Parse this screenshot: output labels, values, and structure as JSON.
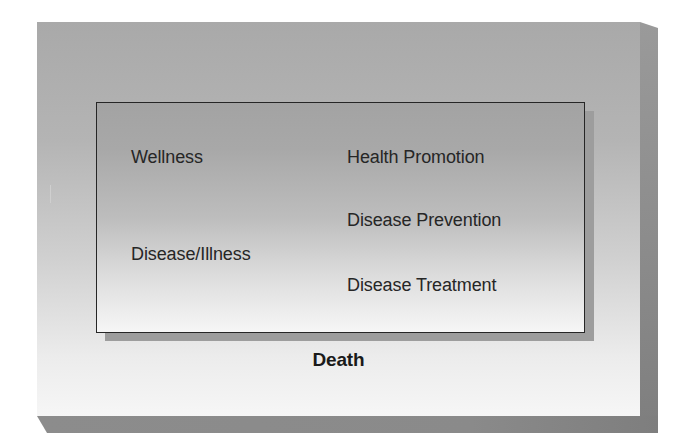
{
  "diagram": {
    "type": "spectrum",
    "outer": {
      "top_label": "Optimal Health",
      "bottom_label": "Death"
    },
    "inner": {
      "left_column": [
        {
          "label": "Wellness"
        },
        {
          "label": "Disease/Illness"
        }
      ],
      "right_column": [
        {
          "label": "Health Promotion"
        },
        {
          "label": "Disease Prevention"
        },
        {
          "label": "Disease Treatment"
        }
      ]
    },
    "colors": {
      "panel_top": "#a9a9a9",
      "panel_bottom": "#f6f6f6",
      "inner_top": "#a3a3a3",
      "inner_bottom": "#f6f6f6",
      "border": "#262626",
      "bevel": "#8a8a8a",
      "text": "#1e1e1e"
    }
  }
}
